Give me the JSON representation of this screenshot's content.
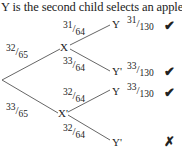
{
  "title": "Y is the second child selects an apple):",
  "diagram": {
    "type": "probability-tree",
    "root_branches": [
      {
        "label": "32/65",
        "to": "X"
      },
      {
        "label": "33/65",
        "to": "X'"
      }
    ],
    "nodes": {
      "X": {
        "name": "X",
        "branches": [
          {
            "label": "31/64",
            "to": "Y",
            "result": "31/130",
            "mark": "✔"
          },
          {
            "label": "33/64",
            "to": "Y'",
            "result": "33/130",
            "mark": "✔"
          }
        ]
      },
      "Xp": {
        "name": "X'",
        "branches": [
          {
            "label": "32/64",
            "to": "Y",
            "result": "33/130",
            "mark": "✔"
          },
          {
            "label": "32/64",
            "to": "Y'",
            "result": "",
            "mark": "✗"
          }
        ]
      }
    }
  },
  "fracs": {
    "r1": {
      "n": "32",
      "d": "65"
    },
    "r2": {
      "n": "33",
      "d": "65"
    },
    "x1": {
      "n": "31",
      "d": "64"
    },
    "x2": {
      "n": "33",
      "d": "64"
    },
    "xp1": {
      "n": "32",
      "d": "64"
    },
    "xp2": {
      "n": "32",
      "d": "64"
    },
    "res1": {
      "n": "31",
      "d": "130"
    },
    "res2": {
      "n": "33",
      "d": "130"
    },
    "res3": {
      "n": "33",
      "d": "130"
    }
  },
  "labels": {
    "x": "X",
    "xp": "X'",
    "y1": "Y",
    "y2": "Y'",
    "y3": "Y",
    "y4": "Y'"
  },
  "marks": {
    "m1": "✔",
    "m2": "✔",
    "m3": "✔",
    "m4": "✗"
  }
}
